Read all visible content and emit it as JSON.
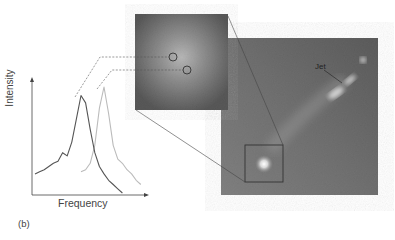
{
  "figure": {
    "panel_label": "(b)",
    "spectrum_chart": {
      "x_axis_label": "Frequency",
      "y_axis_label": "Intensity"
    },
    "large_image": {
      "annotation": "Jet"
    }
  },
  "chart_data": {
    "type": "line",
    "title": "",
    "xlabel": "Frequency",
    "ylabel": "Intensity",
    "grid": false,
    "legend": "none",
    "series": [
      {
        "name": "dark spectrum (upper-left circle)",
        "color": "#555555",
        "x": [
          0,
          4,
          8,
          12,
          16,
          20,
          24,
          28,
          32,
          36,
          40,
          44,
          48,
          52,
          56,
          60,
          64,
          68,
          72,
          76
        ],
        "values": [
          18,
          20,
          22,
          25,
          28,
          30,
          38,
          35,
          48,
          70,
          92,
          85,
          60,
          38,
          25,
          18,
          12,
          8,
          4,
          0
        ]
      },
      {
        "name": "light spectrum (lower-right circle)",
        "color": "#bbbbbb",
        "x": [
          40,
          44,
          48,
          52,
          56,
          60,
          64,
          68,
          72,
          76,
          80,
          84,
          88,
          92
        ],
        "values": [
          20,
          22,
          28,
          45,
          80,
          100,
          75,
          45,
          32,
          28,
          22,
          18,
          12,
          8
        ]
      }
    ]
  },
  "colors": {
    "axis": "#444444",
    "dark_line": "#555555",
    "light_line": "#bbbbbb",
    "connector": "#555555"
  }
}
